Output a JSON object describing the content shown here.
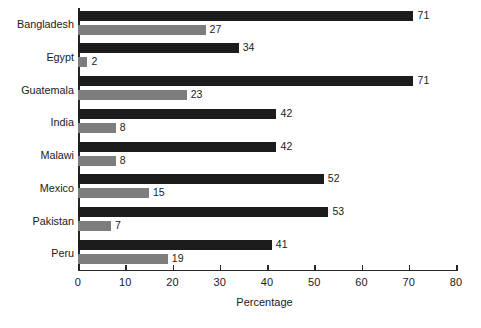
{
  "chart_data": {
    "type": "bar",
    "orientation": "horizontal",
    "title": "",
    "subtitle": "",
    "xlabel": "Percentage",
    "ylabel": "",
    "xlim": [
      0,
      80
    ],
    "xticks": [
      0,
      10,
      20,
      30,
      40,
      50,
      60,
      70,
      80
    ],
    "xtick_labels": [
      "0",
      "10",
      "20",
      "30",
      "40",
      "50",
      "60",
      "70",
      "80"
    ],
    "grid": false,
    "legend": false,
    "legend_position": "none",
    "categories": [
      "Bangladesh",
      "Egypt",
      "Guatemala",
      "India",
      "Malawi",
      "Mexico",
      "Pakistan",
      "Peru"
    ],
    "series": [
      {
        "name": "series-1",
        "color": "#1c1c1c",
        "values": [
          71,
          34,
          71,
          42,
          42,
          52,
          53,
          41
        ],
        "labels": [
          "71",
          "34",
          "71",
          "42",
          "42",
          "52",
          "53",
          "41"
        ]
      },
      {
        "name": "series-2",
        "color": "#7d7d7d",
        "values": [
          27,
          2,
          23,
          8,
          8,
          15,
          7,
          19
        ],
        "labels": [
          "27",
          "2",
          "23",
          "8",
          "8",
          "15",
          "7",
          "19"
        ]
      }
    ]
  },
  "colors": {
    "series_dark": "#1c1c1c",
    "series_gray": "#7d7d7d",
    "axis": "#262626",
    "text": "#1a1a1a",
    "background": "#ffffff"
  }
}
